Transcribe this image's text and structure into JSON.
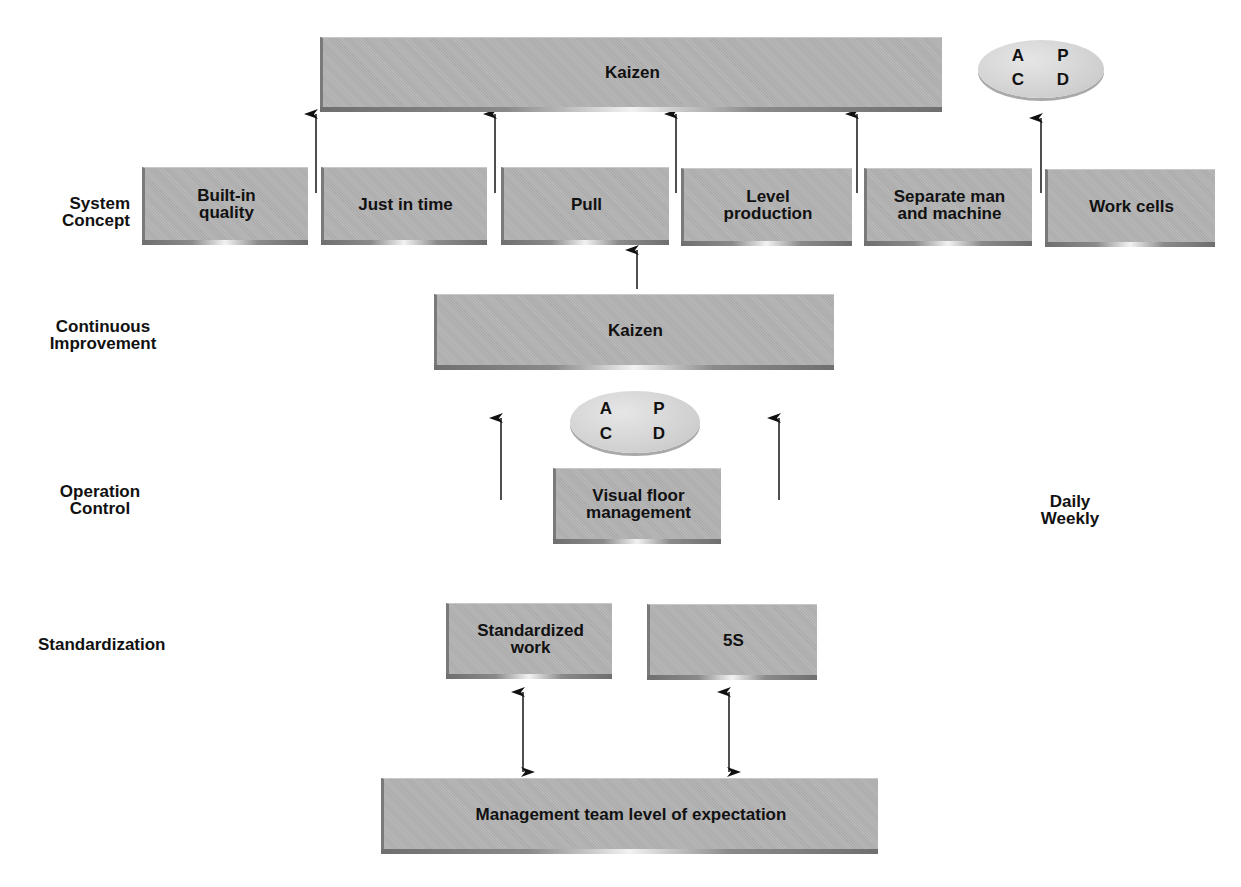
{
  "levels": {
    "system_concept": "System\nConcept",
    "continuous_improvement": "Continuous\nImprovement",
    "operation_control": "Operation\nControl",
    "standardization": "Standardization"
  },
  "top": {
    "kaizen": "Kaizen",
    "pdca": {
      "a": "A",
      "p": "P",
      "c": "C",
      "d": "D"
    }
  },
  "system_concept_boxes": [
    "Built-in\nquality",
    "Just in time",
    "Pull",
    "Level\nproduction",
    "Separate man\nand machine",
    "Work cells"
  ],
  "continuous_improvement": {
    "kaizen": "Kaizen",
    "pdca": {
      "a": "A",
      "p": "P",
      "c": "C",
      "d": "D"
    }
  },
  "operation_control": {
    "box": "Visual floor\nmanagement",
    "frequency": "Daily\nWeekly"
  },
  "standardization": {
    "boxes": [
      "Standardized\nwork",
      "5S"
    ]
  },
  "foundation": {
    "box": "Management team level of expectation"
  }
}
